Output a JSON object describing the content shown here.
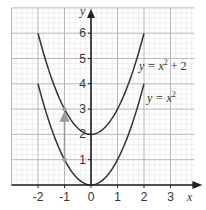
{
  "chart_data": {
    "type": "line",
    "title": "",
    "xlabel": "x",
    "ylabel": "y",
    "xlim": [
      -3,
      3.9
    ],
    "ylim": [
      0,
      7
    ],
    "grid": true,
    "grid_major_step": 1,
    "grid_minor_step": 0.2,
    "x_ticks": [
      "-2",
      "-1",
      "0",
      "1",
      "2",
      "3"
    ],
    "y_ticks": [
      "1",
      "2",
      "3",
      "4",
      "5",
      "6"
    ],
    "series": [
      {
        "name": "y = x² + 2",
        "function": "x^2 + 2",
        "domain": [
          -2,
          2
        ],
        "x": [
          -2,
          -1,
          0,
          1,
          2
        ],
        "y": [
          6,
          3,
          2,
          3,
          6
        ]
      },
      {
        "name": "y = x²",
        "function": "x^2",
        "domain": [
          -2,
          2
        ],
        "x": [
          -2,
          -1,
          0,
          1,
          2
        ],
        "y": [
          4,
          1,
          0,
          1,
          4
        ]
      }
    ],
    "annotations": [
      {
        "type": "arrow",
        "from": [
          -1,
          1
        ],
        "to": [
          -1,
          3
        ],
        "color": "#9a9a9a",
        "points": [
          [
            -1,
            1
          ],
          [
            -1,
            3
          ]
        ]
      },
      {
        "type": "label",
        "text": "y = x² + 2",
        "position": [
          2.0,
          4.7
        ]
      },
      {
        "type": "label",
        "text": "y = x²",
        "position": [
          2.2,
          3.4
        ]
      }
    ]
  },
  "labels": {
    "x_axis": "x",
    "y_axis": "y",
    "eq1_main": "y = x",
    "eq1_exp": "2",
    "eq1_tail": " + 2",
    "eq2_main": "y = x",
    "eq2_exp": "2"
  },
  "colors": {
    "curve": "#333333",
    "axis": "#222222",
    "grid_major": "#b8b8b8",
    "grid_minor": "#e4e4e4",
    "arrow": "#9a9a9a"
  }
}
